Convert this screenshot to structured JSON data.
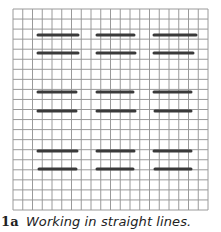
{
  "figure": {
    "caption_number": "1a",
    "caption_text": "Working in straight lines.",
    "grid": {
      "columns": 20,
      "rows": 20,
      "left": 13,
      "top": 9,
      "cell_width": 9.75,
      "cell_height": 10.05,
      "line_color": "#9a9a9a"
    },
    "segment_color": "#3a3a3a",
    "segments": [
      {
        "x1": 38,
        "x2": 78,
        "y": 35
      },
      {
        "x1": 97,
        "x2": 134,
        "y": 35
      },
      {
        "x1": 154,
        "x2": 196,
        "y": 35
      },
      {
        "x1": 38,
        "x2": 78,
        "y": 53
      },
      {
        "x1": 97,
        "x2": 135,
        "y": 53
      },
      {
        "x1": 154,
        "x2": 193,
        "y": 53
      },
      {
        "x1": 38,
        "x2": 76,
        "y": 92
      },
      {
        "x1": 97,
        "x2": 133,
        "y": 92
      },
      {
        "x1": 154,
        "x2": 191,
        "y": 92
      },
      {
        "x1": 38,
        "x2": 76,
        "y": 111
      },
      {
        "x1": 97,
        "x2": 135,
        "y": 111
      },
      {
        "x1": 155,
        "x2": 191,
        "y": 111
      },
      {
        "x1": 38,
        "x2": 77,
        "y": 151
      },
      {
        "x1": 97,
        "x2": 134,
        "y": 151
      },
      {
        "x1": 154,
        "x2": 191,
        "y": 151
      },
      {
        "x1": 39,
        "x2": 76,
        "y": 169
      },
      {
        "x1": 97,
        "x2": 133,
        "y": 169
      },
      {
        "x1": 155,
        "x2": 191,
        "y": 169
      }
    ]
  }
}
